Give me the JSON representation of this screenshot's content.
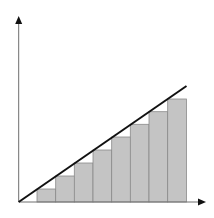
{
  "diagram": {
    "type": "riemann-sum-under-line",
    "colors": {
      "background": "#ffffff",
      "axis": "#6e6e6e",
      "arrowhead": "#111111",
      "bar_fill": "#c4c4c4",
      "bar_stroke": "#8a8a8a",
      "line": "#111111"
    },
    "axes": {
      "origin": [
        18.7,
        202
      ],
      "x_end": 206,
      "y_end": 16,
      "x_label": "",
      "y_label": ""
    },
    "bars": [
      {
        "x": 37.0,
        "top": 189.0
      },
      {
        "x": 55.7,
        "top": 176.0
      },
      {
        "x": 74.3,
        "top": 163.0
      },
      {
        "x": 93.0,
        "top": 150.0
      },
      {
        "x": 111.7,
        "top": 137.0
      },
      {
        "x": 130.3,
        "top": 124.3
      },
      {
        "x": 149.0,
        "top": 111.7
      },
      {
        "x": 167.7,
        "top": 99.0
      }
    ],
    "bar_width": 18.7,
    "line": {
      "x1": 18.7,
      "y1": 202,
      "x2": 186.5,
      "y2": 86
    }
  }
}
